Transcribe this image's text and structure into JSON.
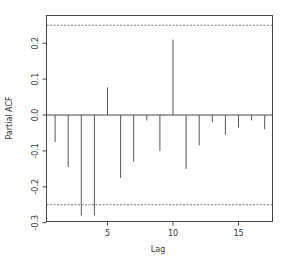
{
  "chart_data": {
    "type": "bar",
    "subtype": "pacf-spike",
    "title": "",
    "xlabel": "Lag",
    "ylabel": "Partial ACF",
    "x": [
      1,
      2,
      3,
      4,
      5,
      6,
      7,
      8,
      9,
      10,
      11,
      12,
      13,
      14,
      15,
      16,
      17
    ],
    "values": [
      -0.075,
      -0.145,
      -0.28,
      -0.28,
      0.077,
      -0.175,
      -0.13,
      -0.015,
      -0.1,
      0.21,
      -0.15,
      -0.085,
      -0.02,
      -0.055,
      -0.035,
      -0.015,
      -0.04
    ],
    "confidence_band": [
      -0.25,
      0.25
    ],
    "xlim": [
      0.4,
      17.6
    ],
    "ylim": [
      -0.3,
      0.265
    ],
    "xticks": [
      5,
      10,
      15
    ],
    "xtick_labels": [
      "5",
      "10",
      "15"
    ],
    "yticks": [
      -0.3,
      -0.2,
      -0.1,
      0.0,
      0.1,
      0.2
    ],
    "ytick_labels": [
      "-0.3",
      "-0.2",
      "-0.1",
      "0.0",
      "0.1",
      "0.2"
    ],
    "grid": false,
    "legend": null,
    "colors": {
      "spike": "#555555",
      "band": "#555555",
      "axis": "#444444"
    }
  }
}
